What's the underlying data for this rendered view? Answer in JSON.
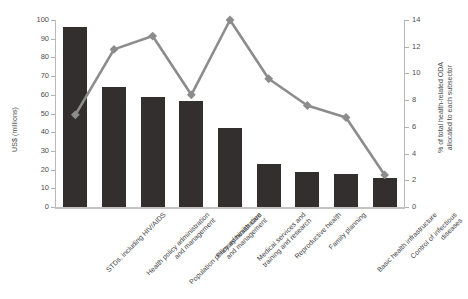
{
  "chart_data": {
    "type": "bar",
    "title": "",
    "subtitle": "",
    "categories": [
      "STDs, including HIV/AIDS",
      "Health policy administration and management",
      "Population policy administration and management",
      "Primary health care",
      "Medical services and training and research",
      "Reproductive health",
      "Family planning",
      "Basic health infrastructure",
      "Control of infectious diseases"
    ],
    "category_lines": [
      [
        "STDs, including HIV/AIDS"
      ],
      [
        "Health policy administration",
        "and management"
      ],
      [
        "Population policy administration",
        "and management"
      ],
      [
        "Primary health care"
      ],
      [
        "Medical services and",
        "training and research"
      ],
      [
        "Reproductive health"
      ],
      [
        "Family planning"
      ],
      [
        "Basic health infrastructure"
      ],
      [
        "Control of infectious",
        "diseases"
      ]
    ],
    "series": [
      {
        "name": "US$ (millions)",
        "kind": "bar",
        "axis": "left",
        "color": "#332f2f",
        "values": [
          96,
          64,
          59,
          56.5,
          42.5,
          23,
          18.5,
          17.5,
          15.5
        ]
      },
      {
        "name": "% of total health-related ODA allocated to each subsector",
        "kind": "line",
        "axis": "right",
        "color": "#8c8c8c",
        "marker": "diamond",
        "values": [
          6.9,
          11.8,
          12.8,
          8.4,
          14.0,
          9.6,
          7.6,
          6.7,
          2.4
        ]
      }
    ],
    "xlabel": "",
    "ylabel": "US$ (millions)",
    "ylabel_right_lines": [
      "% of total health-related ODA",
      "allocated to each subsector"
    ],
    "ylim": [
      0,
      100
    ],
    "ylim_right": [
      0,
      14
    ],
    "ytick_step": 10,
    "ytick_step_right": 2,
    "yticks": [
      0,
      10,
      20,
      30,
      40,
      50,
      60,
      70,
      80,
      90,
      100
    ],
    "yticks_right": [
      0,
      2,
      4,
      6,
      8,
      10,
      12,
      14
    ],
    "grid": false,
    "legend": "none",
    "bar_color": "#332f2f",
    "line_color": "#8c8c8c",
    "axis_color": "#b9b9b9"
  }
}
